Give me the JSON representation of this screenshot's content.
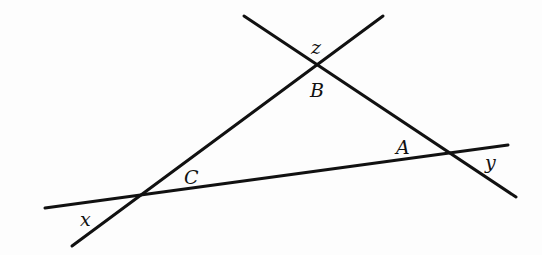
{
  "diagram": {
    "type": "geometry-triangle-with-exterior-angles",
    "stroke_color": "#111111",
    "background": "#fdfdfd",
    "lines": [
      {
        "id": "line-through-C-B",
        "x1": 72,
        "y1": 246,
        "x2": 383,
        "y2": 16
      },
      {
        "id": "line-through-B-A",
        "x1": 244,
        "y1": 16,
        "x2": 516,
        "y2": 197
      },
      {
        "id": "line-through-C-A",
        "x1": 45,
        "y1": 208,
        "x2": 508,
        "y2": 145
      }
    ],
    "vertices": {
      "A": {
        "x": 450,
        "y": 153
      },
      "B": {
        "x": 318,
        "y": 63
      },
      "C": {
        "x": 140,
        "y": 196
      }
    },
    "labels": {
      "A": {
        "text": "A",
        "x": 396,
        "y": 154
      },
      "B": {
        "text": "B",
        "x": 310,
        "y": 97
      },
      "C": {
        "text": "C",
        "x": 184,
        "y": 184
      },
      "x": {
        "text": "x",
        "x": 80,
        "y": 226
      },
      "y": {
        "text": "y",
        "x": 485,
        "y": 169
      },
      "z": {
        "text": "z",
        "x": 311,
        "y": 54
      }
    }
  }
}
